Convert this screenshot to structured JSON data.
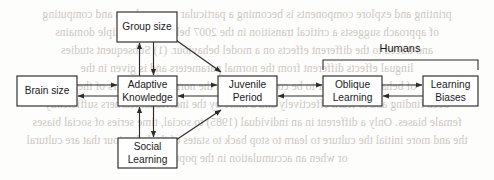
{
  "diagram": {
    "type": "flowchart",
    "bracket": {
      "label": "Humans",
      "covers": [
        "oblique-learning",
        "learning-biases"
      ],
      "x1": 323,
      "x2": 478,
      "y": 60,
      "label_x": 400,
      "label_y": 52
    },
    "nodes": [
      {
        "id": "group-size",
        "label_line1": "Group size",
        "label_line2": "",
        "x": 117,
        "y": 12,
        "w": 60,
        "h": 30
      },
      {
        "id": "brain-size",
        "label_line1": "Brain size",
        "label_line2": "",
        "x": 17,
        "y": 76,
        "w": 60,
        "h": 30
      },
      {
        "id": "adaptive-knowledge",
        "label_line1": "Adaptive",
        "label_line2": "Knowledge",
        "x": 118,
        "y": 76,
        "w": 59,
        "h": 30
      },
      {
        "id": "juvenile-period",
        "label_line1": "Juvenile",
        "label_line2": "Period",
        "x": 218,
        "y": 76,
        "w": 59,
        "h": 30
      },
      {
        "id": "oblique-learning",
        "label_line1": "Oblique",
        "label_line2": "Learning",
        "x": 323,
        "y": 76,
        "w": 59,
        "h": 30
      },
      {
        "id": "learning-biases",
        "label_line1": "Learning",
        "label_line2": "Biases",
        "x": 423,
        "y": 76,
        "w": 55,
        "h": 30
      },
      {
        "id": "social-learning",
        "label_line1": "Social",
        "label_line2": "Learning",
        "x": 118,
        "y": 138,
        "w": 59,
        "h": 30
      }
    ],
    "edges": [
      {
        "id": "brain-to-adaptive",
        "from": "brain-size",
        "to": "adaptive-knowledge",
        "kind": "horizontal-pair"
      },
      {
        "id": "adaptive-to-juvenile",
        "from": "adaptive-knowledge",
        "to": "juvenile-period",
        "kind": "horizontal-pair"
      },
      {
        "id": "juvenile-to-oblique",
        "from": "juvenile-period",
        "to": "oblique-learning",
        "kind": "horizontal-pair"
      },
      {
        "id": "oblique-to-biases",
        "from": "oblique-learning",
        "to": "learning-biases",
        "kind": "horizontal-pair"
      },
      {
        "id": "group-to-adaptive",
        "from": "group-size",
        "to": "adaptive-knowledge",
        "kind": "vertical-pair"
      },
      {
        "id": "adaptive-to-social",
        "from": "adaptive-knowledge",
        "to": "social-learning",
        "kind": "vertical-pair"
      },
      {
        "id": "group-to-juvenile",
        "from": "group-size",
        "to": "juvenile-period",
        "kind": "diagonal"
      },
      {
        "id": "social-to-juvenile",
        "from": "social-learning",
        "to": "juvenile-period",
        "kind": "diagonal"
      }
    ]
  },
  "background_bleed": {
    "description": "faint mirrored show-through text from the reverse side of the scanned page",
    "lines": [
      "printing and explore components is becoming a particular way analyses and computing",
      "of approach suggests a critical transition in the 2007 behaviour. Multiple domains",
      "and traced to the different effects on a model behaviour. (1) Subsequent studies",
      "lingual effects different from the normal parameters and is given in the",
      "of behaviours appear to be conditions with the normal parameters of the",
      "been finding and to learn effectively and a more by the individual learners sufficiently",
      "female biases. Only a different in an individual (1985) to social, time series of social biases",
      "the and more initial the culture to learn to stop back to states of the behaviour that are cultural",
      "or when an accumulation in the population"
    ],
    "tops": [
      8,
      26,
      44,
      62,
      80,
      98,
      116,
      134,
      152
    ]
  }
}
